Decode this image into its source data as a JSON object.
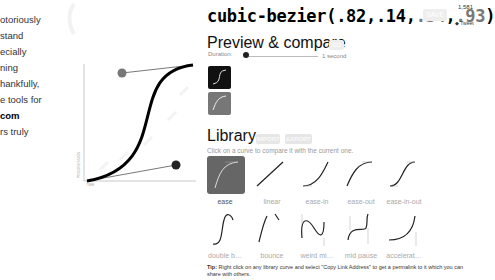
{
  "intro": {
    "lines": [
      "otoriously",
      "stand",
      "ecially",
      "ning",
      "hankfully,",
      "e tools for",
      "com",
      "rs truly"
    ]
  },
  "editor": {
    "axis_y_label": "PROGRESSION",
    "axis_x_label": "TIME",
    "control_point_1_color": "#777777",
    "control_point_2_color": "#222222"
  },
  "header": {
    "prefix": "cubic-bezier(",
    "p1": ".82",
    "p2": ".14",
    "p3": ".34",
    "p4": ".93",
    "suffix": ")",
    "save_label": "SAVE",
    "tweet_count": "1,581",
    "tweet_label": "Tweet"
  },
  "preview": {
    "title": "Preview & compare",
    "go_label": "GO",
    "duration_label": "Duration:",
    "duration_value": "1 second"
  },
  "library": {
    "title": "Library",
    "import_label": "IMPORT",
    "export_label": "EXPORT",
    "subtitle": "Click on a curve to compare it with the current one.",
    "items": [
      {
        "label": "ease",
        "selected": true
      },
      {
        "label": "linear"
      },
      {
        "label": "ease-in"
      },
      {
        "label": "ease-out"
      },
      {
        "label": "ease-in-out"
      },
      {
        "label": "double b…"
      },
      {
        "label": "bounce"
      },
      {
        "label": "weird mi…"
      },
      {
        "label": "mid pause"
      },
      {
        "label": "accelerat…"
      }
    ]
  },
  "tip": {
    "label": "Tip:",
    "text": "Right click on any library curve and select \"Copy Link Address\" to get a permalink to it which you can share with others."
  }
}
